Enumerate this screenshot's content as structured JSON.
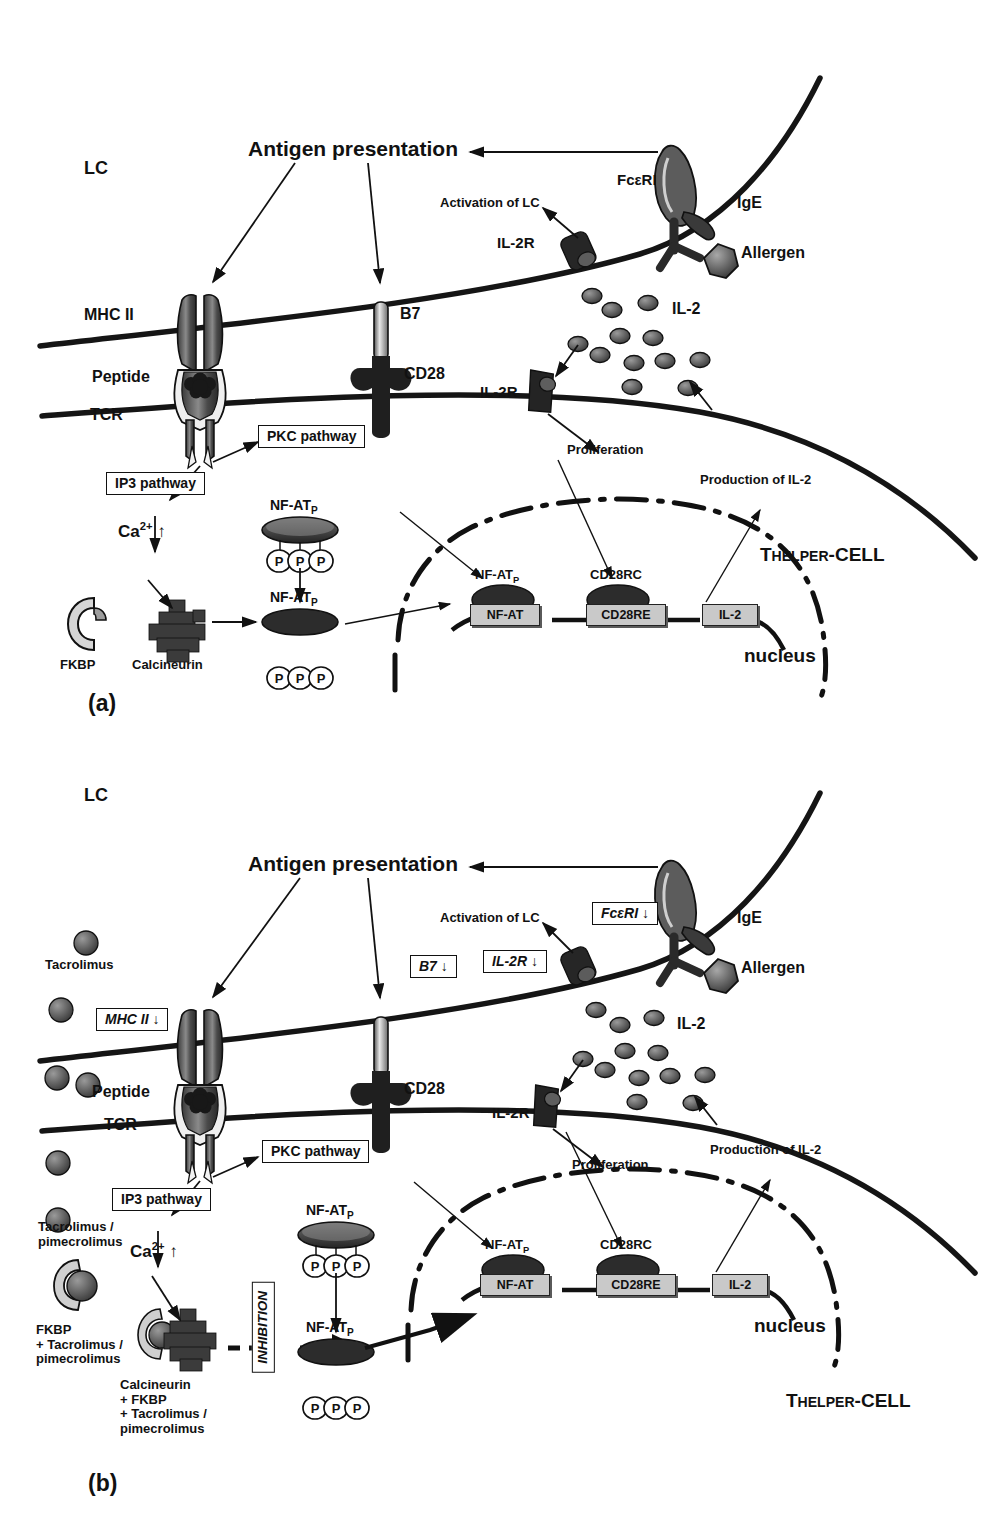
{
  "figure": {
    "type": "biological-pathway-diagram",
    "panels": [
      {
        "id": "a",
        "label": "(a)",
        "caption_note": "Normal antigen presentation and T-cell activation",
        "cells": {
          "lc_label": "LC",
          "thelper_label_main": "T",
          "thelper_label_sub": "HELPER",
          "thelper_label_tail": "-CELL",
          "nucleus_label": "nucleus"
        },
        "labels": {
          "antigen_presentation": "Antigen presentation",
          "mhc2": "MHC II",
          "peptide": "Peptide",
          "tcr": "TCR",
          "b7": "B7",
          "cd28": "CD28",
          "activation_of_lc": "Activation of LC",
          "il2r_top": "IL-2R",
          "il2r_bottom": "IL-2R",
          "fceri": "FcεRI",
          "ige": "IgE",
          "allergen": "Allergen",
          "il2_pool": "IL-2",
          "proliferation": "Proliferation",
          "production_of_il2": "Production of IL-2",
          "pkc_pathway": "PKC pathway",
          "ip3_pathway": "IP3 pathway",
          "calcium": "Ca",
          "calcium_sup": "2+",
          "calcium_arrow": "↑",
          "fkbp": "FKBP",
          "calcineurin": "Calcineurin",
          "nfatp_upper": "NF-AT",
          "nfatp_upper_sub": "P",
          "nfatp_lower": "NF-AT",
          "nfatp_lower_sub": "P",
          "phosphate": "P",
          "nfatp_gene_top": "NF-AT",
          "nfatp_gene_top_sub": "P",
          "cd28rc": "CD28RC"
        },
        "genes": [
          {
            "name": "NF-AT"
          },
          {
            "name": "CD28RE"
          },
          {
            "name": "IL-2"
          }
        ]
      },
      {
        "id": "b",
        "label": "(b)",
        "caption_note": "Effect of tacrolimus / pimecrolimus: inhibition of calcineurin and downregulation of surface molecules",
        "cells": {
          "lc_label": "LC",
          "thelper_label_main": "T",
          "thelper_label_sub": "HELPER",
          "thelper_label_tail": "-CELL",
          "nucleus_label": "nucleus"
        },
        "labels": {
          "antigen_presentation": "Antigen presentation",
          "peptide": "Peptide",
          "tcr": "TCR",
          "cd28": "CD28",
          "activation_of_lc": "Activation of LC",
          "il2r_bottom": "IL-2R",
          "ige": "IgE",
          "allergen": "Allergen",
          "il2_pool": "IL-2",
          "proliferation": "Proliferation",
          "production_of_il2": "Production of IL-2",
          "pkc_pathway": "PKC pathway",
          "ip3_pathway": "IP3 pathway",
          "calcium": "Ca",
          "calcium_sup": "2+",
          "calcium_arrow": "↑",
          "tacrolimus": "Tacrolimus",
          "tacrolimus_pimecrolimus": "Tacrolimus /\npimecrolimus",
          "fkbp_complex": "FKBP\n+ Tacrolimus /\npimecrolimus",
          "calcineurin_complex": "Calcineurin\n+ FKBP\n+ Tacrolimus /\npimecrolimus",
          "inhibition": "INHIBITION",
          "nfatp_upper": "NF-AT",
          "nfatp_upper_sub": "P",
          "nfatp_lower": "NF-AT",
          "nfatp_lower_sub": "P",
          "phosphate": "P",
          "nfatp_gene_top": "NF-AT",
          "nfatp_gene_top_sub": "P",
          "cd28rc": "CD28RC"
        },
        "downregulation_boxes": [
          {
            "id": "mhc2-down",
            "text": "MHC II ↓"
          },
          {
            "id": "b7-down",
            "text": "B7 ↓"
          },
          {
            "id": "fceri-down",
            "text": "FcεRI ↓"
          },
          {
            "id": "il2r-down",
            "text": "IL-2R ↓"
          }
        ],
        "genes": [
          {
            "name": "NF-AT"
          },
          {
            "name": "CD28RE"
          },
          {
            "name": "IL-2"
          }
        ]
      }
    ],
    "colors": {
      "ink": "#111111",
      "membrane": "#151515",
      "gene_box_fill": "#c9c9c9",
      "protein_dark": "#2b2b2b",
      "protein_mid": "#6a6a6a",
      "protein_light": "#bdbdbd",
      "background": "#ffffff"
    }
  }
}
